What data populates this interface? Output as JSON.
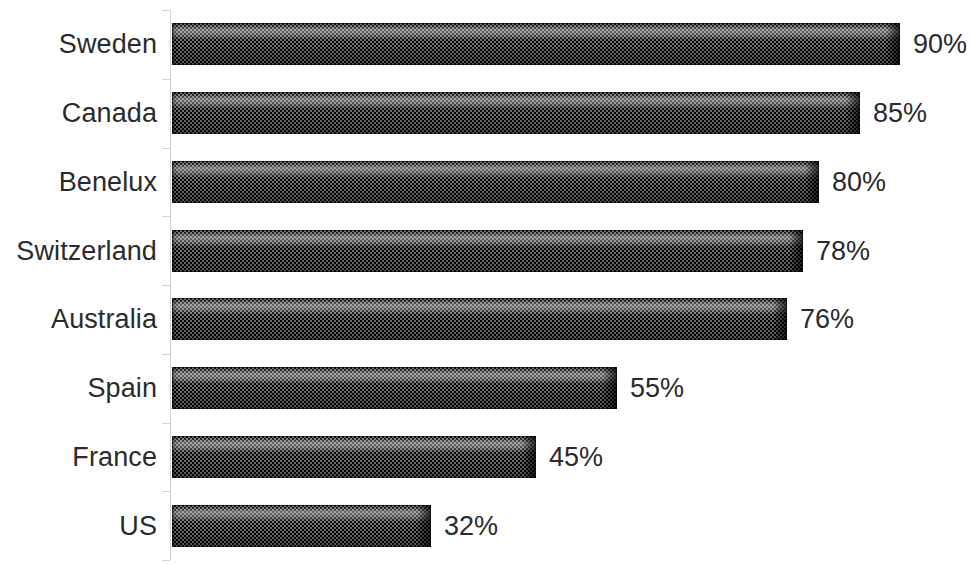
{
  "chart_data": {
    "type": "bar",
    "orientation": "horizontal",
    "title": "",
    "subtitle": "",
    "xlabel": "",
    "ylabel": "",
    "xlim": [
      0,
      100
    ],
    "grid": false,
    "legend": null,
    "value_suffix": "%",
    "categories": [
      "Sweden",
      "Canada",
      "Benelux",
      "Switzerland",
      "Australia",
      "Spain",
      "France",
      "US"
    ],
    "values": [
      90,
      85,
      80,
      78,
      76,
      55,
      45,
      32
    ],
    "data_labels": [
      "90%",
      "85%",
      "80%",
      "78%",
      "76%",
      "55%",
      "45%",
      "32%"
    ],
    "series": [
      {
        "name": "",
        "values": [
          90,
          85,
          80,
          78,
          76,
          55,
          45,
          32
        ]
      }
    ],
    "points": [
      {
        "category": "Sweden",
        "value": 90,
        "label": "90%"
      },
      {
        "category": "Canada",
        "value": 85,
        "label": "85%"
      },
      {
        "category": "Benelux",
        "value": 80,
        "label": "80%"
      },
      {
        "category": "Switzerland",
        "value": 78,
        "label": "78%"
      },
      {
        "category": "Australia",
        "value": 76,
        "label": "76%"
      },
      {
        "category": "Spain",
        "value": 55,
        "label": "55%"
      },
      {
        "category": "France",
        "value": 45,
        "label": "45%"
      },
      {
        "category": "US",
        "value": 32,
        "label": "32%"
      }
    ],
    "colors": {
      "bar_fill": "#3b3b3b",
      "bar_fill_light": "#6e6e6e",
      "bar_outline": "#000000",
      "axis_line": "#d2d2d2",
      "text": "#2b2b2b",
      "background": "#ffffff"
    }
  }
}
